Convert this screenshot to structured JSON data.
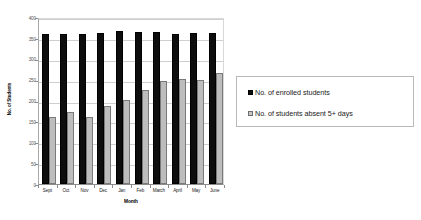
{
  "chart_data": {
    "type": "bar",
    "title": "",
    "xlabel": "Month",
    "ylabel": "No. of Students",
    "ylim": [
      0,
      400
    ],
    "yticks": [
      0,
      50,
      100,
      150,
      200,
      250,
      300,
      350,
      400
    ],
    "grid": true,
    "legend_position": "right",
    "categories": [
      "Sept",
      "Oct",
      "Nov",
      "Dec",
      "Jan",
      "Feb",
      "March",
      "April",
      "May",
      "June"
    ],
    "series": [
      {
        "name": "No. of enrolled students",
        "color": "#0d0d0d",
        "values": [
          360,
          360,
          360,
          362,
          366,
          365,
          365,
          360,
          362,
          362
        ]
      },
      {
        "name": "No. of students absent 5+ days",
        "color": "#bdbdbd",
        "values": [
          160,
          173,
          161,
          188,
          201,
          225,
          247,
          252,
          248,
          265
        ]
      }
    ]
  },
  "legend": {
    "entries": [
      {
        "label": "No. of enrolled students"
      },
      {
        "label": "No. of students absent 5+ days"
      }
    ]
  }
}
